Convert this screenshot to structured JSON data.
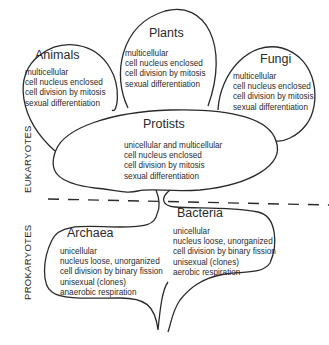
{
  "groups": {
    "eukaryotes_label": "EUKARYOTES",
    "prokaryotes_label": "PROKARYOTES"
  },
  "nodes": {
    "animals": {
      "title": "Animals",
      "traits": [
        "multicellular",
        "cell nucleus enclosed",
        "cell division by mitosis",
        "sexual differentiation"
      ]
    },
    "plants": {
      "title": "Plants",
      "traits": [
        "multicellular",
        "cell nucleus enclosed",
        "cell division by mitosis",
        "sexual differentiation"
      ]
    },
    "fungi": {
      "title": "Fungi",
      "traits": [
        "multicellular",
        "cell nucleus enclosed",
        "cell division by mitosis",
        "sexual differentiation"
      ]
    },
    "protists": {
      "title": "Protists",
      "traits": [
        "unicellular and multicellular",
        "cell nucleus enclosed",
        "cell division by mitosis",
        "sexual differentiation"
      ]
    },
    "archaea": {
      "title": "Archaea",
      "traits": [
        "unicellular",
        "nucleus loose, unorganized",
        "cell division by binary fission",
        "unisexual (clones)",
        "anaerobic respiration"
      ]
    },
    "bacteria": {
      "title": "Bacteria",
      "traits": [
        "unicellular",
        "nucleus loose, unorganized",
        "cell division by binary fission",
        "unisexual (clones)",
        "aerobic respiration"
      ]
    }
  }
}
